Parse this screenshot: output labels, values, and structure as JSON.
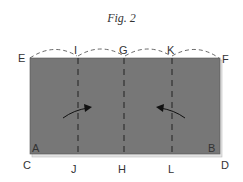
{
  "figure": {
    "title": "Fig. 2",
    "paper_color": "#777777",
    "paper_back_color": "#e4e4e4",
    "line_color": "#222222"
  },
  "labels": {
    "E": "E",
    "I": "I",
    "G": "G",
    "K": "K",
    "F": "F",
    "A": "A",
    "B": "B",
    "C": "C",
    "J": "J",
    "H": "H",
    "L": "L",
    "D": "D"
  }
}
